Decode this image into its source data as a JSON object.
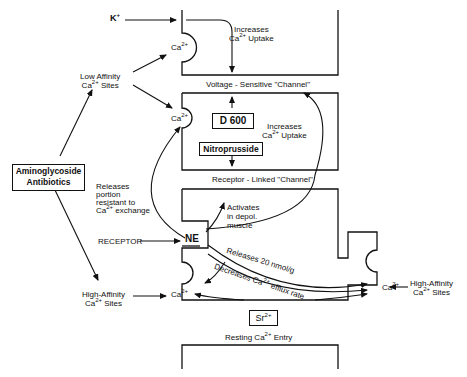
{
  "diagram": {
    "type": "calcium-flux-pathway-diagram",
    "nodes": {
      "k_plus": "K",
      "k_plus_sup": "+",
      "aminoglycoside": [
        "Aminoglycoside",
        "Antibiotics"
      ],
      "low_affinity_sites": [
        "Low Affinity",
        "Ca",
        "2+",
        " Sites"
      ],
      "high_affinity_sites_left": [
        "High-Affinity",
        "Ca",
        "2+",
        " Sites"
      ],
      "high_affinity_sites_right": [
        "High-Affinity",
        "Ca",
        "2+",
        " Sites"
      ],
      "receptor": "RECEPTOR",
      "ne": "NE",
      "d600": "D 600",
      "nitroprusside": "Nitroprusside",
      "sr": "Sr",
      "sr_sup": "2+",
      "ca_label": "Ca",
      "ca_sup": "2+"
    },
    "channels": {
      "voltage_sensitive": "Voltage - Sensitive \"Channel\"",
      "receptor_linked": "Receptor - Linked \"Channel\"",
      "resting_entry_pre": "Resting Ca",
      "resting_entry_sup": "2+",
      "resting_entry_post": " Entry"
    },
    "annotations": {
      "increases_uptake_top": [
        "Increases",
        "Ca",
        "2+",
        " Uptake"
      ],
      "increases_uptake_mid": [
        "Increases",
        "Ca",
        "2+",
        " Uptake"
      ],
      "releases_portion": [
        "Releases",
        "portion",
        "resistant to",
        "Ca",
        "2+",
        " exchange"
      ],
      "activates": [
        "Activates",
        "in depol.",
        "muscle"
      ],
      "releases_20": "Releases 20 nmol/g",
      "decreases_efflux_pre": "Decreases Ca",
      "decreases_efflux_sup": "2+",
      "decreases_efflux_post": " efflux rate"
    }
  }
}
